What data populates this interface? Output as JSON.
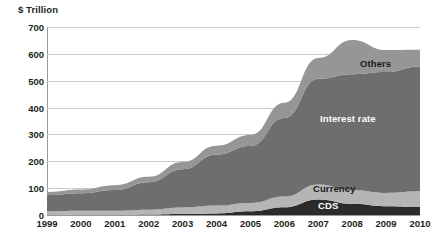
{
  "chart_data": {
    "type": "area",
    "stacked": true,
    "title": "",
    "subtitle": "",
    "xlabel": "",
    "ylabel": "$ Trillion",
    "y_axis_unit_title": "$ Trillion",
    "grid": true,
    "legend_position": "in-chart",
    "x": [
      1999,
      2000,
      2001,
      2002,
      2003,
      2004,
      2005,
      2006,
      2007,
      2008,
      2009,
      2010
    ],
    "categories": [
      "1999",
      "2000",
      "2001",
      "2002",
      "2003",
      "2004",
      "2005",
      "2006",
      "2007",
      "2008",
      "2009",
      "2010"
    ],
    "xlim": [
      1999,
      2010
    ],
    "ylim": [
      0,
      700
    ],
    "y_ticks": [
      0,
      100,
      200,
      300,
      400,
      500,
      600,
      700
    ],
    "y_tick_labels": [
      "0",
      "100",
      "200",
      "300",
      "400",
      "500",
      "600",
      "700"
    ],
    "series": [
      {
        "name": "CDS",
        "color": "#2b2b2b",
        "label_color": "#ffffff",
        "values": [
          0,
          0,
          0,
          2,
          4,
          6,
          14,
          29,
          58,
          42,
          33,
          30
        ]
      },
      {
        "name": "Currency",
        "color": "#b5b5b5",
        "label_color": "#1a1a1a",
        "values": [
          14,
          16,
          16,
          18,
          24,
          29,
          31,
          40,
          56,
          50,
          49,
          58
        ]
      },
      {
        "name": "Interest rate",
        "color": "#6e6e6e",
        "label_color": "#ffffff",
        "values": [
          60,
          65,
          77,
          102,
          142,
          190,
          212,
          292,
          393,
          432,
          450,
          465
        ]
      },
      {
        "name": "Others",
        "color": "#969696",
        "label_color": "#1a1a1a",
        "values": [
          12,
          14,
          18,
          20,
          27,
          33,
          41,
          57,
          78,
          128,
          82,
          62
        ]
      }
    ],
    "totals": [
      86,
      95,
      111,
      142,
      197,
      258,
      298,
      418,
      585,
      652,
      614,
      615
    ],
    "annotations": [
      {
        "text": "Others",
        "series": "Others",
        "x_px": 360,
        "y_px": 58,
        "text_color": "#1a1a1a"
      },
      {
        "text": "Interest rate",
        "series": "Interest rate",
        "x_px": 320,
        "y_px": 113,
        "text_color": "#ffffff"
      },
      {
        "text": "Currency",
        "series": "Currency",
        "x_px": 313,
        "y_px": 183,
        "text_color": "#1a1a1a"
      },
      {
        "text": "CDS",
        "series": "CDS",
        "x_px": 318,
        "y_px": 200,
        "text_color": "#ffffff"
      }
    ],
    "colors": {
      "cds": "#2b2b2b",
      "currency": "#b5b5b5",
      "interest_rate": "#6e6e6e",
      "others": "#969696",
      "gridline": "#c9c9c9",
      "axis": "#9a9a9a",
      "text": "#231f20",
      "background": "#ffffff"
    }
  }
}
